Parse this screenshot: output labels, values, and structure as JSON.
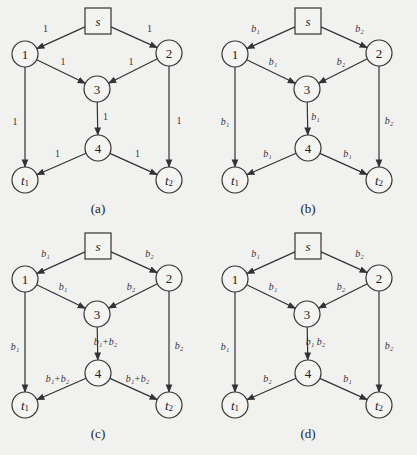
{
  "figure": {
    "nodes": {
      "s": {
        "label": "s",
        "shape": "square"
      },
      "n1": {
        "label": "1"
      },
      "n2": {
        "label": "2"
      },
      "n3": {
        "label": "3"
      },
      "n4": {
        "label": "4"
      },
      "t1": {
        "label": "t",
        "sub": "1"
      },
      "t2": {
        "label": "t",
        "sub": "2"
      }
    },
    "panels": [
      {
        "id": "a",
        "caption": "(a)",
        "edge_labels": {
          "s_1": "1",
          "s_2": "1",
          "1_3": "1",
          "2_3": "1",
          "1_t1": "1",
          "2_t2": "1",
          "3_4": "1",
          "4_t1": "1",
          "4_t2": "1"
        }
      },
      {
        "id": "b",
        "caption": "(b)",
        "edge_labels": {
          "s_1": "b₁",
          "s_2": "b₂",
          "1_3": "b₁",
          "2_3": "b₂",
          "1_t1": "b₁",
          "2_t2": "b₂",
          "3_4": "b₁",
          "4_t1": "b₁",
          "4_t2": "b₁"
        }
      },
      {
        "id": "c",
        "caption": "(c)",
        "edge_labels": {
          "s_1": "b₁",
          "s_2": "b₂",
          "1_3": "b₁",
          "2_3": "b₂",
          "1_t1": "b₁",
          "2_t2": "b₂",
          "3_4": "b₁+b₂",
          "4_t1": "b₁+b₂",
          "4_t2": "b₁+b₂"
        }
      },
      {
        "id": "d",
        "caption": "(d)",
        "edge_labels": {
          "s_1": "b₁",
          "s_2": "b₂",
          "1_3": "b₁",
          "2_3": "b₂",
          "1_t1": "b₁",
          "2_t2": "b₂",
          "3_4": "b₁ b₂",
          "4_t1": "b₂",
          "4_t2": "b₁"
        }
      }
    ],
    "colors": {
      "background": "#f1f1f0",
      "stroke": "#333333",
      "node_fill": "#f4f4f3"
    }
  }
}
